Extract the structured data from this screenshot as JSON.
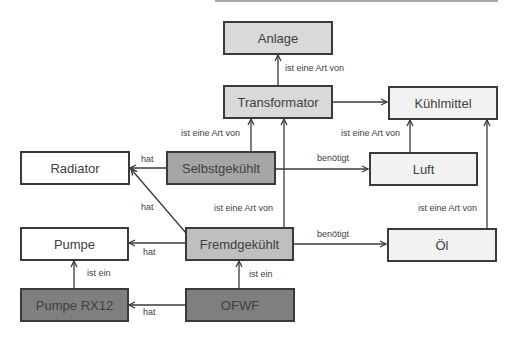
{
  "colors": {
    "gray_light": "#d9d9d9",
    "gray_mid": "#a6a6a6",
    "gray_dark": "#7f7f7f",
    "gray_pale": "#f2f2f2",
    "white": "#ffffff",
    "line": "#3a3a3a"
  },
  "nodes": {
    "anlage": "Anlage",
    "transformator": "Transformator",
    "kuehlmittel": "Kühlmittel",
    "radiator": "Radiator",
    "selbstgekuehlt": "Selbstgekühlt",
    "luft": "Luft",
    "pumpe": "Pumpe",
    "fremdgekuehlt": "Fremdgekühlt",
    "oel": "Öl",
    "pumpe_rx12": "Pumpe RX12",
    "ofwf": "OFWF"
  },
  "edges": {
    "transformator_anlage": "ist eine Art von",
    "luft_kuehlmittel": "ist eine Art von",
    "selbst_transformator": "ist eine Art von",
    "selbst_radiator": "hat",
    "selbst_luft": "benötigt",
    "fremd_radiator": "hat",
    "fremd_transformator": "ist eine Art von",
    "oel_kuehlmittel": "ist eine Art von",
    "fremd_pumpe": "hat",
    "fremd_oel": "benötigt",
    "rx12_pumpe": "ist ein",
    "ofwf_fremd": "ist ein",
    "ofwf_rx12": "hat"
  }
}
